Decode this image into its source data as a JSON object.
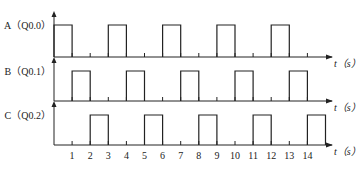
{
  "diagram": {
    "type": "timing",
    "time_unit_label": "t（s）",
    "time_ticks": [
      "1",
      "2",
      "3",
      "4",
      "5",
      "6",
      "7",
      "8",
      "9",
      "10",
      "11",
      "12",
      "13",
      "14"
    ],
    "signals": [
      {
        "name": "A",
        "label": "A（Q0.0）",
        "high_intervals": [
          [
            0,
            1
          ],
          [
            3,
            4
          ],
          [
            6,
            7
          ],
          [
            9,
            10
          ],
          [
            12,
            13
          ]
        ]
      },
      {
        "name": "B",
        "label": "B（Q0.1）",
        "high_intervals": [
          [
            1,
            2
          ],
          [
            4,
            5
          ],
          [
            7,
            8
          ],
          [
            10,
            11
          ],
          [
            13,
            14
          ]
        ]
      },
      {
        "name": "C",
        "label": "C（Q0.2）",
        "high_intervals": [
          [
            2,
            3
          ],
          [
            5,
            6
          ],
          [
            8,
            9
          ],
          [
            11,
            12
          ],
          [
            14,
            15
          ]
        ]
      }
    ]
  }
}
